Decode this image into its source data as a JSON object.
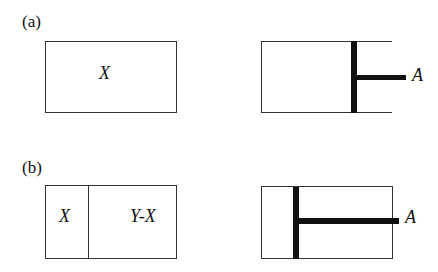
{
  "panels": [
    {
      "label": "(a)",
      "left": {
        "regions": [
          "X"
        ]
      },
      "right": {
        "rod_label": "A"
      }
    },
    {
      "label": "(b)",
      "left": {
        "regions": [
          "X",
          "Y-X"
        ]
      },
      "right": {
        "rod_label": "A"
      }
    }
  ],
  "colors": {
    "line": "#333333",
    "piston": "#111111",
    "background": "#ffffff"
  }
}
